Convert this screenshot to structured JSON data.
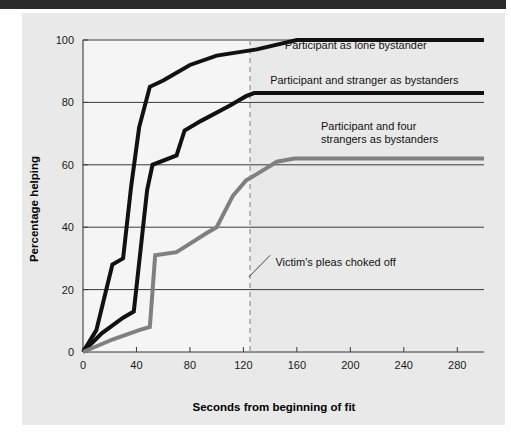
{
  "page": {
    "background_color": "#ffffff",
    "top_bar_color": "#2b2b2b",
    "panel_color": "#e9e9e9"
  },
  "chart_data": {
    "type": "line",
    "title": "",
    "xlabel": "Seconds from beginning of fit",
    "ylabel": "Percentage helping",
    "xlim": [
      0,
      300
    ],
    "ylim": [
      0,
      100
    ],
    "xticks": [
      0,
      40,
      80,
      120,
      160,
      200,
      240,
      280
    ],
    "xtick_labels": [
      "0",
      "40",
      "80",
      "120",
      "160",
      "200",
      "240",
      "280"
    ],
    "yticks": [
      0,
      20,
      40,
      60,
      80,
      100
    ],
    "ytick_labels": [
      "0",
      "20",
      "40",
      "60",
      "80",
      "100"
    ],
    "grid": "horizontal",
    "legend_position": "inline-right-of-curves",
    "series": [
      {
        "name": "Participant as lone bystander",
        "color": "#111111",
        "width": 4,
        "points": [
          [
            0,
            0
          ],
          [
            10,
            7
          ],
          [
            22,
            28
          ],
          [
            30,
            30
          ],
          [
            36,
            53
          ],
          [
            42,
            72
          ],
          [
            50,
            85
          ],
          [
            60,
            87
          ],
          [
            80,
            92
          ],
          [
            100,
            95
          ],
          [
            130,
            97
          ],
          [
            160,
            100
          ],
          [
            300,
            100
          ]
        ]
      },
      {
        "name": "Participant and  stranger as bystanders",
        "color": "#111111",
        "width": 4,
        "points": [
          [
            0,
            0
          ],
          [
            14,
            6
          ],
          [
            30,
            11
          ],
          [
            38,
            13
          ],
          [
            48,
            52
          ],
          [
            52,
            60
          ],
          [
            70,
            63
          ],
          [
            76,
            71
          ],
          [
            88,
            74
          ],
          [
            110,
            79
          ],
          [
            122,
            82
          ],
          [
            128,
            83
          ],
          [
            300,
            83
          ]
        ]
      },
      {
        "name": "Participant and four strangers as bystanders",
        "color": "#808080",
        "width": 4,
        "points": [
          [
            0,
            0
          ],
          [
            22,
            4
          ],
          [
            42,
            7
          ],
          [
            50,
            8
          ],
          [
            54,
            31
          ],
          [
            70,
            32
          ],
          [
            92,
            38
          ],
          [
            100,
            40
          ],
          [
            112,
            50
          ],
          [
            122,
            55
          ],
          [
            130,
            57
          ],
          [
            145,
            61
          ],
          [
            158,
            62
          ],
          [
            300,
            62
          ]
        ]
      }
    ],
    "annotations": [
      {
        "name": "victims-pleas-annotation",
        "text": "Victim's pleas choked off",
        "x": 144,
        "y": 29,
        "leader_from": [
          124,
          24
        ],
        "leader_to": [
          140,
          31
        ]
      }
    ],
    "vline": {
      "name": "victim-pleas-cutoff-line",
      "x": 125,
      "style": "dashed",
      "color": "#a8a8a8"
    },
    "shaded_region": {
      "from_x": 0,
      "to_x": 125,
      "color": "#f5f5f5"
    },
    "series_labels": [
      {
        "name": "Participant as lone bystander",
        "lines": [
          "Participant as lone bystander"
        ],
        "x": 151,
        "y": 97
      },
      {
        "name": "Participant and  stranger as bystanders",
        "lines": [
          "Participant and  stranger as bystanders"
        ],
        "x": 140,
        "y": 86
      },
      {
        "name": "Participant and four strangers as bystanders",
        "lines": [
          "Participant and four",
          "strangers as bystanders"
        ],
        "x": 178,
        "y": 71
      }
    ]
  }
}
